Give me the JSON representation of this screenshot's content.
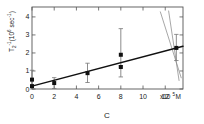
{
  "chart_data": {
    "type": "scatter",
    "title": "",
    "subtitle": "",
    "xlabel": "C",
    "ylabel": "T2^-1 (10^6 sec^-1)",
    "x_unit_suffix": "x10",
    "x_unit_exponent": "5",
    "x_unit_molar": "M",
    "y_label_main": "T",
    "y_label_sub": "2",
    "y_label_sup": "-1",
    "y_label_paren_open": "(",
    "y_label_base": "10",
    "y_label_base_exp": "6",
    "y_label_sec": "sec",
    "y_label_sec_exp": "-1",
    "y_label_paren_close": ")",
    "xlim": [
      0,
      13.6
    ],
    "ylim": [
      0,
      4.55
    ],
    "xticks": [
      0,
      2,
      4,
      6,
      8,
      10,
      12
    ],
    "xticklabels": [
      "0",
      "2",
      "4",
      "6",
      "8",
      "10",
      "12"
    ],
    "yticks": [
      0,
      1,
      2,
      3,
      4
    ],
    "yticklabels": [
      "0",
      "1",
      "2",
      "3",
      "4"
    ],
    "grid": false,
    "legend": null,
    "marker": "filled-square",
    "marker_color": "#111111",
    "line_color": "#111111",
    "errorbar_color": "#777777",
    "frame": "box",
    "tick_direction": "in",
    "points": [
      {
        "x": 0.0,
        "y": 0.52,
        "yerr_low": 0.52,
        "yerr_high": 0.52
      },
      {
        "x": 0.0,
        "y": 0.16,
        "yerr_low": 0.0,
        "yerr_high": 0.0
      },
      {
        "x": 2.0,
        "y": 0.33,
        "yerr_low": 0.3,
        "yerr_high": 0.3
      },
      {
        "x": 5.0,
        "y": 0.88,
        "yerr_low": 0.52,
        "yerr_high": 0.55
      },
      {
        "x": 8.0,
        "y": 1.9,
        "yerr_low": 0.6,
        "yerr_high": 1.45
      },
      {
        "x": 8.0,
        "y": 1.22,
        "yerr_low": 0.55,
        "yerr_high": 0.0
      },
      {
        "x": 13.0,
        "y": 2.28,
        "yerr_low": 0.7,
        "yerr_high": 0.75
      }
    ],
    "fit_line": {
      "intercept": 0.16,
      "slope": 0.163,
      "x_start": 0.0,
      "x_end": 13.6
    },
    "bound_lines": [
      {
        "x1": 11.55,
        "y1": 4.3,
        "x2": 13.45,
        "y2": 0.6
      },
      {
        "x1": 12.3,
        "y1": 4.35,
        "x2": 13.25,
        "y2": 0.45
      }
    ]
  }
}
